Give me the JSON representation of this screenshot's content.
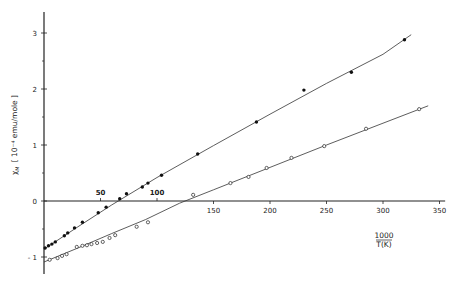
{
  "chart_data": {
    "type": "scatter",
    "title": "",
    "xlabel": "1000 / T(K)",
    "xlabel_numerator": "1000",
    "xlabel_denominator": "T(K)",
    "ylabel": "χM [ 10⁻⁴ emu/mole ]",
    "ylabel_symbol": "χ",
    "ylabel_subscript": "M",
    "ylabel_units": "[ 10⁻⁴ emu/mole ]",
    "xlim": [
      0,
      355
    ],
    "ylim": [
      -1.25,
      3.4
    ],
    "grid": false,
    "x_ticks": [
      50,
      100,
      150,
      200,
      250,
      300,
      350
    ],
    "y_ticks": [
      -1,
      0,
      1,
      2,
      3
    ],
    "y_minor_ticks": [
      -0.5,
      0.5,
      1.5,
      2.5
    ],
    "series": [
      {
        "name": "filled",
        "marker": "filled-circle",
        "points": [
          [
            1,
            -0.84
          ],
          [
            4,
            -0.8
          ],
          [
            7,
            -0.77
          ],
          [
            10,
            -0.73
          ],
          [
            18,
            -0.62
          ],
          [
            21,
            -0.57
          ],
          [
            27,
            -0.48
          ],
          [
            34,
            -0.38
          ],
          [
            48,
            -0.21
          ],
          [
            55,
            -0.11
          ],
          [
            67,
            0.04
          ],
          [
            73,
            0.13
          ],
          [
            87,
            0.25
          ],
          [
            92,
            0.32
          ],
          [
            104,
            0.46
          ],
          [
            136,
            0.84
          ],
          [
            188,
            1.41
          ],
          [
            230,
            1.98
          ],
          [
            272,
            2.3
          ],
          [
            319,
            2.88
          ]
        ],
        "fit_line": [
          [
            0,
            -0.86
          ],
          [
            30,
            -0.46
          ],
          [
            60,
            -0.07
          ],
          [
            100,
            0.42
          ],
          [
            150,
            0.99
          ],
          [
            200,
            1.55
          ],
          [
            250,
            2.1
          ],
          [
            300,
            2.62
          ],
          [
            325,
            2.97
          ]
        ]
      },
      {
        "name": "open",
        "marker": "open-circle",
        "points": [
          [
            5,
            -1.05
          ],
          [
            12,
            -1.02
          ],
          [
            16,
            -0.98
          ],
          [
            20,
            -0.95
          ],
          [
            29,
            -0.82
          ],
          [
            34,
            -0.8
          ],
          [
            38,
            -0.79
          ],
          [
            42,
            -0.77
          ],
          [
            47,
            -0.75
          ],
          [
            52,
            -0.73
          ],
          [
            58,
            -0.66
          ],
          [
            63,
            -0.61
          ],
          [
            82,
            -0.46
          ],
          [
            92,
            -0.38
          ],
          [
            132,
            0.11
          ],
          [
            165,
            0.32
          ],
          [
            181,
            0.43
          ],
          [
            197,
            0.59
          ],
          [
            219,
            0.77
          ],
          [
            248,
            0.98
          ],
          [
            285,
            1.29
          ],
          [
            332,
            1.64
          ]
        ],
        "fit_line": [
          [
            0,
            -1.09
          ],
          [
            30,
            -0.84
          ],
          [
            60,
            -0.58
          ],
          [
            90,
            -0.33
          ],
          [
            120,
            -0.04
          ],
          [
            150,
            0.2
          ],
          [
            200,
            0.6
          ],
          [
            250,
            1.0
          ],
          [
            300,
            1.39
          ],
          [
            340,
            1.7
          ]
        ]
      }
    ],
    "annotations": []
  }
}
